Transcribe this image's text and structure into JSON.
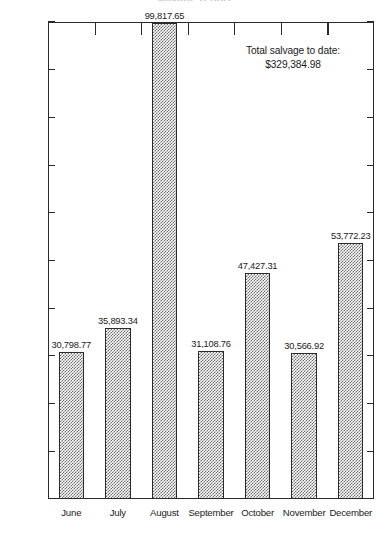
{
  "chart_data": {
    "type": "bar",
    "title": "",
    "xlabel": "",
    "ylabel": "",
    "categories": [
      "June",
      "July",
      "August",
      "September",
      "October",
      "November",
      "December"
    ],
    "values": [
      30798.77,
      35893.34,
      99817.65,
      31108.76,
      47427.31,
      30566.92,
      53772.23
    ],
    "value_labels": [
      "30,798.77",
      "35,893.34",
      "99,817.65",
      "31,108.76",
      "47,427.31",
      "30,566.92",
      "53,772.23"
    ],
    "ylim": [
      0,
      100000
    ],
    "y_ticks": [
      100000,
      90000,
      80000,
      70000,
      60000,
      50000,
      40000,
      30000,
      20000,
      10000
    ],
    "y_tick_labels": [
      "100,000",
      "90,000",
      "80,000",
      "70,000",
      "60,000",
      "50,000",
      "40,000",
      "30,000",
      "20,000",
      "10,000"
    ],
    "grid": false,
    "legend": "none",
    "bar_fill": "gray-checker-hatch",
    "bar_edge_color": "#2b2b2b",
    "annotations": [
      {
        "line1": "Total salvage to date:",
        "line2": "$329,384.98"
      }
    ]
  },
  "annotation": {
    "line1": "Total salvage to date:",
    "line2": "$329,384.98"
  },
  "clipped_title": "salvage report"
}
